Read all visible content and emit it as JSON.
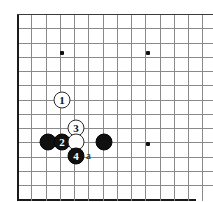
{
  "diagram": {
    "type": "go-board-problem-diagram",
    "board": {
      "line_color": "#8a8a8a",
      "edge_color": "#1a1a1a",
      "background": "#ffffff",
      "origin_x": 17,
      "origin_y": 14,
      "spacing": 14.25,
      "columns": 14,
      "rows": 13,
      "left_edge_is_board_boundary": true,
      "bottom_edge_is_board_boundary": true,
      "right_edge_cropped": true,
      "top_edge_cropped": false
    },
    "star_points": [
      {
        "name": "hoshi-upper-left",
        "x": 62,
        "y": 53
      },
      {
        "name": "hoshi-upper-right",
        "x": 148,
        "y": 53
      },
      {
        "name": "hoshi-lower-right",
        "x": 148,
        "y": 144
      }
    ],
    "stones": [
      {
        "id": "white-1",
        "color": "white",
        "label": "1",
        "x": 62,
        "y": 100
      },
      {
        "id": "black-plain-left",
        "color": "black",
        "label": "",
        "x": 48,
        "y": 142
      },
      {
        "id": "black-2",
        "color": "black",
        "label": "2",
        "x": 62,
        "y": 142
      },
      {
        "id": "white-3",
        "color": "white",
        "label": "3",
        "x": 76,
        "y": 128
      },
      {
        "id": "white-plain",
        "color": "white",
        "label": "",
        "x": 76,
        "y": 142
      },
      {
        "id": "black-plain-right",
        "color": "black",
        "label": "",
        "x": 104,
        "y": 142
      },
      {
        "id": "black-4",
        "color": "black",
        "label": "4",
        "x": 76,
        "y": 156
      }
    ],
    "labels": [
      {
        "id": "point-a",
        "text": "a",
        "x": 90,
        "y": 157
      }
    ]
  }
}
